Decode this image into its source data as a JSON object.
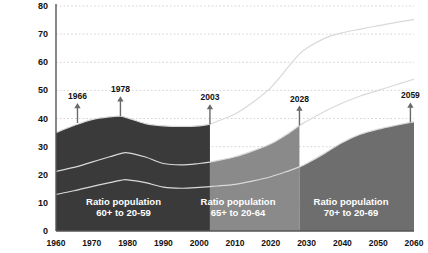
{
  "chart_data": {
    "type": "area",
    "title": "",
    "xlabel": "",
    "ylabel": "",
    "xlim": [
      1960,
      2060
    ],
    "ylim": [
      0,
      80
    ],
    "grid": true,
    "legend_position": "inline-panel-labels",
    "xticks": [
      "1960",
      "1970",
      "1980",
      "1990",
      "2000",
      "2010",
      "2020",
      "2030",
      "2040",
      "2050",
      "2060"
    ],
    "yticks": [
      "0",
      "10",
      "20",
      "30",
      "40",
      "50",
      "60",
      "70",
      "80"
    ],
    "x": [
      1960,
      1965,
      1970,
      1975,
      1978,
      1980,
      1985,
      1990,
      1995,
      2000,
      2003,
      2005,
      2010,
      2015,
      2020,
      2025,
      2028,
      2030,
      2035,
      2040,
      2045,
      2050,
      2055,
      2059,
      2060
    ],
    "series": [
      {
        "name": "Ratio population 60+ to 20-59",
        "shade_range": [
          1960,
          2003
        ],
        "color": "#3a3a3a",
        "values": [
          35.0,
          37.5,
          39.6,
          40.6,
          40.8,
          40.2,
          38.2,
          37.4,
          37.2,
          37.4,
          38.0,
          39.0,
          41.6,
          45.8,
          51.0,
          58.5,
          63.0,
          65.0,
          68.5,
          70.5,
          71.8,
          73.0,
          74.2,
          75.0,
          75.2
        ]
      },
      {
        "name": "Ratio population 65+ to 20-64",
        "shade_range": [
          2003,
          2028
        ],
        "color": "#8a8a8a",
        "values": [
          21.2,
          22.6,
          24.5,
          26.4,
          27.5,
          27.8,
          26.3,
          24.0,
          23.5,
          24.0,
          24.5,
          25.0,
          26.4,
          28.5,
          31.0,
          34.8,
          37.5,
          39.0,
          42.5,
          45.5,
          48.0,
          50.0,
          52.0,
          53.6,
          54.0
        ]
      },
      {
        "name": "Ratio population 70+ to 20-69",
        "shade_range": [
          2028,
          2060
        ],
        "color": "#6e6e6e",
        "values": [
          13.0,
          14.3,
          15.8,
          17.2,
          18.0,
          18.2,
          17.2,
          15.6,
          15.2,
          15.5,
          15.8,
          16.0,
          16.6,
          17.8,
          19.3,
          21.4,
          22.8,
          24.0,
          27.6,
          31.5,
          34.4,
          36.2,
          37.6,
          38.6,
          38.8
        ]
      }
    ],
    "annotations": [
      {
        "year": 1966,
        "label": "1966",
        "value": 38.4
      },
      {
        "year": 1978,
        "label": "1978",
        "value": 40.8
      },
      {
        "year": 2003,
        "label": "2003",
        "value": 38.0
      },
      {
        "year": 2028,
        "label": "2028",
        "value": 37.5
      },
      {
        "year": 2059,
        "label": "2059",
        "value": 38.6
      }
    ],
    "panel_labels": [
      {
        "line1": "Ratio population",
        "line2": "60+ to 20-59"
      },
      {
        "line1": "Ratio population",
        "line2": "65+ to 20-64"
      },
      {
        "line1": "Ratio population",
        "line2": "70+ to 20-69"
      }
    ],
    "colors": {
      "panel1": "#3a3a3a",
      "panel2": "#8a8a8a",
      "panel3": "#6e6e6e",
      "line": "#d9d9d9",
      "axis": "#555555",
      "grid": "#c9c9c9",
      "text": "#111111",
      "label_text": "#ffffff"
    }
  }
}
